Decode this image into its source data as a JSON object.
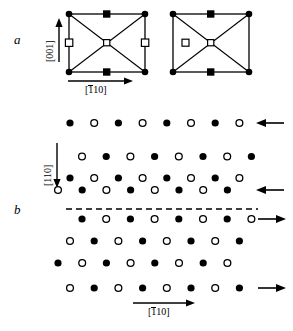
{
  "figure": {
    "panels": [
      {
        "id": "a",
        "label": "a",
        "description": "Two unit-cell schematics with corner atoms, edge-midpoint atoms and body-centre atom, crossed by diagonals",
        "axis_vertical": "[001]",
        "axis_horizontal_prefix": "1",
        "axis_horizontal_suffix": "10",
        "axis_horizontal": "[110]",
        "cells": [
          {
            "name": "left-cell",
            "corner_markers": "filled-circle",
            "top_mid_marker": "filled-square",
            "bottom_mid_marker": "filled-square",
            "left_mid_marker": "open-square",
            "right_mid_marker": "open-square",
            "centre_marker": "open-square",
            "diagonals": "true"
          },
          {
            "name": "right-cell",
            "corner_markers": "filled-circle",
            "top_mid_marker": "filled-square",
            "bottom_mid_marker": "filled-square",
            "left_mid_marker": "open-square",
            "right_mid_marker": "none",
            "centre_marker": "open-square",
            "diagonals": "true"
          }
        ]
      },
      {
        "id": "b",
        "label": "b",
        "description": "Plan view lattice of alternating filled and open circles split by a horizontal dashed domain boundary, with step-edge arrows",
        "axis_vertical": "[110]",
        "axis_horizontal_prefix": "1",
        "axis_horizontal_suffix": "10",
        "axis_horizontal": "[110]",
        "boundary": "dashed-line",
        "rows_above": 4,
        "rows_below": 4,
        "atoms_per_row": 8,
        "arrows": [
          {
            "row": 1,
            "direction": "left"
          },
          {
            "row": 4,
            "direction": "left"
          },
          {
            "row": 5,
            "direction": "right"
          },
          {
            "row": 8,
            "direction": "right"
          }
        ]
      }
    ]
  },
  "colors": {
    "stroke": "#000000",
    "fill_marker": "#000000",
    "open_marker": "#ffffff",
    "background": "#ffffff"
  }
}
